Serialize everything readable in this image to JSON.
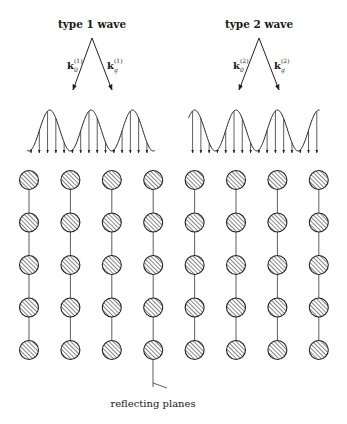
{
  "diagram": {
    "waves": [
      {
        "id": "type1",
        "title": "type 1 wave",
        "k_incident": {
          "base": "k",
          "sub": "0",
          "sup": "(1)"
        },
        "k_diffracted": {
          "base": "k",
          "sub": "g",
          "sup": "(1)"
        },
        "standing_wave_phase": "nodes on atomic planes",
        "crest_count": 3
      },
      {
        "id": "type2",
        "title": "type 2 wave",
        "k_incident": {
          "base": "k",
          "sub": "0",
          "sup": "(2)"
        },
        "k_diffracted": {
          "base": "k",
          "sub": "g",
          "sup": "(2)"
        },
        "standing_wave_phase": "antinodes on atomic planes",
        "crest_count": 4
      }
    ],
    "lattice": {
      "columns": 8,
      "rows": 5,
      "atom_fill": "hatched"
    },
    "caption": "reflecting planes",
    "colors": {
      "ink": "#222222",
      "background": "#ffffff"
    }
  }
}
